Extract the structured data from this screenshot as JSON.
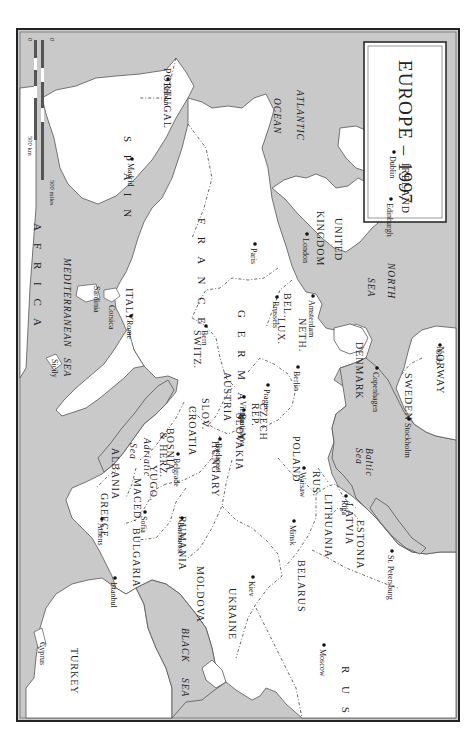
{
  "map": {
    "title": "EUROPE – 1997",
    "orientation": "rotated 90° clockwise (north to the right)",
    "colors": {
      "sea": "#c9c9c9",
      "land": "#ffffff",
      "border": "#444444",
      "frame": "#222222"
    },
    "scale_bar": {
      "km_label": "500 km",
      "miles_label": "500 miles",
      "zero_km": "0",
      "zero_miles": "0"
    },
    "seas": [
      {
        "name": "ATLANTIC",
        "x": 281,
        "y": 62
      },
      {
        "name": "OCEAN",
        "x": 258,
        "y": 70
      },
      {
        "name": "NORTH",
        "x": 372,
        "y": 235
      },
      {
        "name": "SEA",
        "x": 352,
        "y": 250
      },
      {
        "name": "MEDITERRANEAN",
        "x": 48,
        "y": 230
      },
      {
        "name": "SEA",
        "x": 48,
        "y": 330
      },
      {
        "name": "BLACK",
        "x": 166,
        "y": 600
      },
      {
        "name": "SEA",
        "x": 166,
        "y": 650
      },
      {
        "name": "Baltic",
        "x": 350,
        "y": 420
      },
      {
        "name": "Sea",
        "x": 340,
        "y": 420
      },
      {
        "name": "Adriatic",
        "x": 128,
        "y": 410
      },
      {
        "name": "Sea",
        "x": 114,
        "y": 415
      }
    ],
    "countries": [
      {
        "name": "PORTUGAL",
        "x": 148,
        "y": 40
      },
      {
        "name": "S P A I N",
        "x": 108,
        "y": 108
      },
      {
        "name": "IRELAND",
        "x": 386,
        "y": 135
      },
      {
        "name": "UNITED",
        "x": 319,
        "y": 190
      },
      {
        "name": "KINGDOM",
        "x": 301,
        "y": 183
      },
      {
        "name": "F R A N C E",
        "x": 182,
        "y": 190
      },
      {
        "name": "BEL.",
        "x": 268,
        "y": 265
      },
      {
        "name": "NETH.",
        "x": 283,
        "y": 290
      },
      {
        "name": "LUX.",
        "x": 262,
        "y": 290
      },
      {
        "name": "G E R M A N Y",
        "x": 222,
        "y": 282
      },
      {
        "name": "SWITZ.",
        "x": 178,
        "y": 302
      },
      {
        "name": "AUSTRIA",
        "x": 208,
        "y": 344
      },
      {
        "name": "CZECH",
        "x": 244,
        "y": 375
      },
      {
        "name": "REP.",
        "x": 236,
        "y": 375
      },
      {
        "name": "POLAND",
        "x": 277,
        "y": 408
      },
      {
        "name": "SLOV.",
        "x": 186,
        "y": 370
      },
      {
        "name": "SLOVAKIA",
        "x": 220,
        "y": 385
      },
      {
        "name": "CROATIA",
        "x": 173,
        "y": 378
      },
      {
        "name": "HUNGARY",
        "x": 196,
        "y": 413
      },
      {
        "name": "BOSNIA",
        "x": 151,
        "y": 400
      },
      {
        "name": "& HERZ.",
        "x": 144,
        "y": 404
      },
      {
        "name": "ITALY",
        "x": 110,
        "y": 260
      },
      {
        "name": "YUGO.",
        "x": 134,
        "y": 437
      },
      {
        "name": "ALBANIA",
        "x": 96,
        "y": 420
      },
      {
        "name": "MACED.",
        "x": 118,
        "y": 450
      },
      {
        "name": "GREECE",
        "x": 85,
        "y": 465
      },
      {
        "name": "BULGARIA",
        "x": 117,
        "y": 500
      },
      {
        "name": "RUMANIA",
        "x": 163,
        "y": 488
      },
      {
        "name": "MOLDOVA",
        "x": 181,
        "y": 538
      },
      {
        "name": "UKRAINE",
        "x": 213,
        "y": 560
      },
      {
        "name": "BELARUS",
        "x": 282,
        "y": 532
      },
      {
        "name": "LITHUANIA",
        "x": 309,
        "y": 466
      },
      {
        "name": "LATVIA",
        "x": 330,
        "y": 475
      },
      {
        "name": "ESTONIA",
        "x": 341,
        "y": 492
      },
      {
        "name": "RUS.",
        "x": 297,
        "y": 443
      },
      {
        "name": "DENMARK",
        "x": 340,
        "y": 314
      },
      {
        "name": "NORWAY",
        "x": 421,
        "y": 318
      },
      {
        "name": "SWEDEN",
        "x": 389,
        "y": 345
      },
      {
        "name": "R U S S I A",
        "x": 326,
        "y": 638
      },
      {
        "name": "TURKEY",
        "x": 55,
        "y": 620
      },
      {
        "name": "A F R I C A",
        "x": 18,
        "y": 195
      }
    ],
    "cities": [
      {
        "name": "Lisbon",
        "x": 148,
        "y": 55
      },
      {
        "name": "Madrid",
        "x": 112,
        "y": 135
      },
      {
        "name": "Dublin",
        "x": 374,
        "y": 128
      },
      {
        "name": "Edinburgh",
        "x": 371,
        "y": 175
      },
      {
        "name": "London",
        "x": 287,
        "y": 210
      },
      {
        "name": "Paris",
        "x": 235,
        "y": 220
      },
      {
        "name": "Brussels",
        "x": 257,
        "y": 273
      },
      {
        "name": "Amsterdam",
        "x": 293,
        "y": 272
      },
      {
        "name": "Bern",
        "x": 186,
        "y": 302
      },
      {
        "name": "Berlin",
        "x": 278,
        "y": 343
      },
      {
        "name": "Oslo",
        "x": 420,
        "y": 321
      },
      {
        "name": "Copenhagen",
        "x": 357,
        "y": 344
      },
      {
        "name": "Stockholm",
        "x": 389,
        "y": 395
      },
      {
        "name": "Prague",
        "x": 248,
        "y": 361
      },
      {
        "name": "Vienna",
        "x": 224,
        "y": 373
      },
      {
        "name": "Bratislava",
        "x": 224,
        "y": 386
      },
      {
        "name": "Budapest",
        "x": 200,
        "y": 415
      },
      {
        "name": "Warsaw",
        "x": 284,
        "y": 444
      },
      {
        "name": "Riga",
        "x": 326,
        "y": 472
      },
      {
        "name": "Minsk",
        "x": 274,
        "y": 497
      },
      {
        "name": "St. Petersburg",
        "x": 372,
        "y": 527
      },
      {
        "name": "Moscow",
        "x": 304,
        "y": 621
      },
      {
        "name": "Kiev",
        "x": 233,
        "y": 553
      },
      {
        "name": "Rome",
        "x": 111,
        "y": 292
      },
      {
        "name": "Belgrade",
        "x": 158,
        "y": 430
      },
      {
        "name": "Sofia",
        "x": 125,
        "y": 488
      },
      {
        "name": "Bucharest",
        "x": 162,
        "y": 494
      },
      {
        "name": "Athens",
        "x": 82,
        "y": 495
      },
      {
        "name": "Istanbul",
        "x": 95,
        "y": 554
      }
    ],
    "islands": [
      {
        "name": "Sardinia",
        "x": 78,
        "y": 258
      },
      {
        "name": "Corsica",
        "x": 93,
        "y": 277
      },
      {
        "name": "Sicily",
        "x": 36,
        "y": 331
      },
      {
        "name": "Cyprus",
        "x": 24,
        "y": 614
      }
    ]
  }
}
